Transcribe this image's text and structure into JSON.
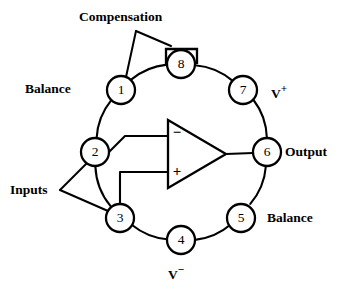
{
  "diagram": {
    "type": "schematic-pinout",
    "background_color": "#ffffff",
    "line_color": "#000000",
    "package": {
      "pin_count": 8,
      "orientation_marker": "square-notch-above-pin-8"
    },
    "pins": [
      {
        "number": "1",
        "cx": 121,
        "cy": 90,
        "label": "Balance"
      },
      {
        "number": "2",
        "cx": 95,
        "cy": 152,
        "label": "Inputs"
      },
      {
        "number": "3",
        "cx": 120,
        "cy": 218,
        "label": "Inputs"
      },
      {
        "number": "4",
        "cx": 181,
        "cy": 240,
        "label": "V−"
      },
      {
        "number": "5",
        "cx": 241,
        "cy": 218,
        "label": "Balance"
      },
      {
        "number": "6",
        "cx": 267,
        "cy": 152,
        "label": "Output"
      },
      {
        "number": "7",
        "cx": 243,
        "cy": 90,
        "label": "V+"
      },
      {
        "number": "8",
        "cx": 181,
        "cy": 64,
        "label": "Compensation"
      }
    ],
    "labels": {
      "compensation": "Compensation",
      "balance_top": "Balance",
      "balance_bottom": "Balance",
      "inputs": "Inputs",
      "output": "Output",
      "v_plus_base": "V",
      "v_plus_sup": "+",
      "v_minus_base": "V",
      "v_minus_sup": "−"
    },
    "amplifier": {
      "symbol": "triangle",
      "inverting_sign": "−",
      "noninverting_sign": "+",
      "inverting_input_pin": "2",
      "noninverting_input_pin": "3",
      "output_pin": "6"
    },
    "geometry": {
      "ring_center_x": 181,
      "ring_center_y": 154,
      "ring_radius": 66,
      "pin_radius": 14
    }
  }
}
